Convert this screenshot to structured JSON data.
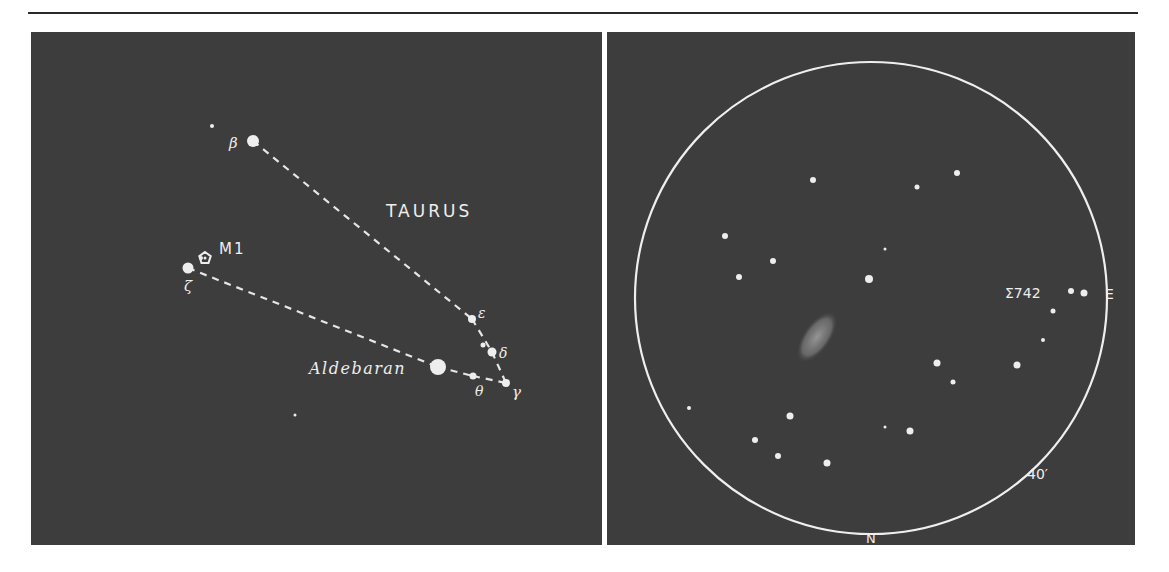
{
  "finder_chart": {
    "constellation_label": "TAURUS",
    "object_label": "M1",
    "bright_star_label": "Aldebaran",
    "stars": [
      {
        "id": "beta",
        "label": "β",
        "x": 222,
        "y": 109,
        "r": 6
      },
      {
        "id": "zeta",
        "label": "ζ",
        "x": 157,
        "y": 236,
        "r": 5.5
      },
      {
        "id": "epsilon",
        "label": "ε",
        "x": 441,
        "y": 287,
        "r": 4
      },
      {
        "id": "delta",
        "label": "δ",
        "x": 461,
        "y": 320,
        "r": 4.5
      },
      {
        "id": "gamma",
        "label": "γ",
        "x": 475,
        "y": 351,
        "r": 4
      },
      {
        "id": "theta",
        "label": "θ",
        "x": 442,
        "y": 344,
        "r": 3.5
      },
      {
        "id": "aldebaran",
        "label": "",
        "x": 407,
        "y": 335,
        "r": 8
      }
    ],
    "minor_stars": [
      {
        "x": 181,
        "y": 94,
        "r": 2
      },
      {
        "x": 264,
        "y": 383,
        "r": 1.5
      },
      {
        "x": 170,
        "y": 226,
        "r": 2
      },
      {
        "x": 452,
        "y": 313,
        "r": 2.5
      }
    ],
    "m1_marker": {
      "x": 174,
      "y": 226
    }
  },
  "eyepiece_view": {
    "direction_east": "E",
    "direction_north": "N",
    "field_size": "40′",
    "double_star_label": "Σ742",
    "circle": {
      "cx": 264,
      "cy": 266,
      "r": 236
    },
    "nebula": {
      "cx": 210,
      "cy": 305,
      "rx": 14,
      "ry": 30,
      "rotate": 35
    },
    "stars": [
      {
        "x": 206,
        "y": 148,
        "r": 3
      },
      {
        "x": 310,
        "y": 155,
        "r": 2.5
      },
      {
        "x": 350,
        "y": 141,
        "r": 3
      },
      {
        "x": 118,
        "y": 204,
        "r": 3
      },
      {
        "x": 166,
        "y": 229,
        "r": 3
      },
      {
        "x": 132,
        "y": 245,
        "r": 3
      },
      {
        "x": 262,
        "y": 247,
        "r": 4
      },
      {
        "x": 278,
        "y": 217,
        "r": 1.5
      },
      {
        "x": 464,
        "y": 259,
        "r": 3
      },
      {
        "x": 477,
        "y": 261,
        "r": 3.5
      },
      {
        "x": 446,
        "y": 279,
        "r": 2.5
      },
      {
        "x": 436,
        "y": 308,
        "r": 2
      },
      {
        "x": 410,
        "y": 333,
        "r": 3.5
      },
      {
        "x": 330,
        "y": 331,
        "r": 3.5
      },
      {
        "x": 346,
        "y": 350,
        "r": 2.5
      },
      {
        "x": 82,
        "y": 376,
        "r": 2
      },
      {
        "x": 183,
        "y": 384,
        "r": 3.5
      },
      {
        "x": 148,
        "y": 408,
        "r": 3
      },
      {
        "x": 171,
        "y": 424,
        "r": 3
      },
      {
        "x": 220,
        "y": 431,
        "r": 3.5
      },
      {
        "x": 278,
        "y": 395,
        "r": 1.5
      },
      {
        "x": 303,
        "y": 399,
        "r": 3.5
      }
    ]
  },
  "colors": {
    "sky": "#3d3d3d",
    "ink": "#eeeeee",
    "page": "#ffffff"
  }
}
